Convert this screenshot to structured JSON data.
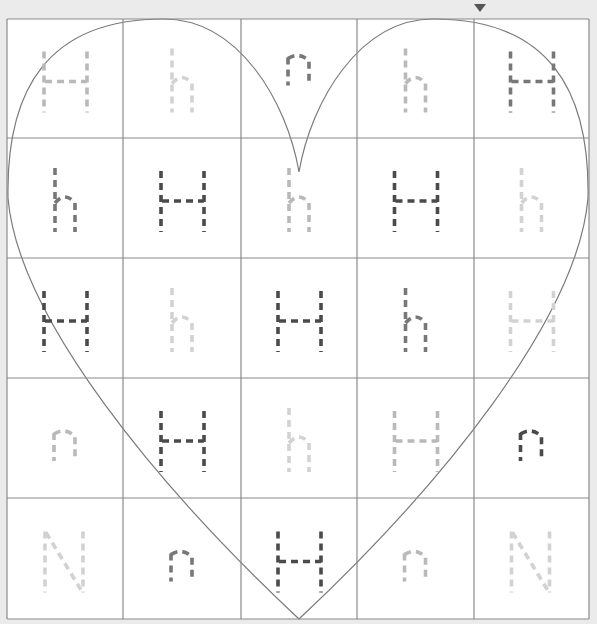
{
  "worksheet": {
    "title": "Letter H heart tracing grid",
    "colors": {
      "background": "#ebebeb",
      "paper": "#ffffff",
      "grid_line": "#8a8a8a",
      "heart_line": "#7a7a7a",
      "dark": "#4a4a4a",
      "medium": "#777777",
      "light": "#b9b9b9",
      "faint": "#d2d2d2",
      "corner_mark": "#555555"
    },
    "grid": {
      "columns": 5,
      "rows": 5,
      "x_lines": [
        7,
        123,
        241,
        357,
        474,
        589
      ],
      "y_lines": [
        19,
        138,
        258,
        378,
        498,
        619
      ]
    },
    "heart": {
      "notch": [
        299,
        172
      ],
      "bottom_point": [
        299,
        619
      ]
    },
    "cells": [
      [
        {
          "letter": "H",
          "shade": "light"
        },
        {
          "letter": "h",
          "shade": "faint"
        },
        {
          "letter": "n",
          "shade": "medium"
        },
        {
          "letter": "h",
          "shade": "light"
        },
        {
          "letter": "H",
          "shade": "medium"
        }
      ],
      [
        {
          "letter": "h",
          "shade": "medium"
        },
        {
          "letter": "H",
          "shade": "dark"
        },
        {
          "letter": "h",
          "shade": "light"
        },
        {
          "letter": "H",
          "shade": "dark"
        },
        {
          "letter": "h",
          "shade": "faint"
        }
      ],
      [
        {
          "letter": "H",
          "shade": "dark"
        },
        {
          "letter": "h",
          "shade": "faint"
        },
        {
          "letter": "H",
          "shade": "dark"
        },
        {
          "letter": "h",
          "shade": "medium"
        },
        {
          "letter": "H",
          "shade": "faint"
        }
      ],
      [
        {
          "letter": "n",
          "shade": "light"
        },
        {
          "letter": "H",
          "shade": "dark"
        },
        {
          "letter": "h",
          "shade": "faint"
        },
        {
          "letter": "H",
          "shade": "light"
        },
        {
          "letter": "n",
          "shade": "dark"
        }
      ],
      [
        {
          "letter": "N",
          "shade": "faint"
        },
        {
          "letter": "n",
          "shade": "medium"
        },
        {
          "letter": "H",
          "shade": "dark"
        },
        {
          "letter": "n",
          "shade": "light"
        },
        {
          "letter": "N",
          "shade": "faint"
        }
      ]
    ]
  }
}
